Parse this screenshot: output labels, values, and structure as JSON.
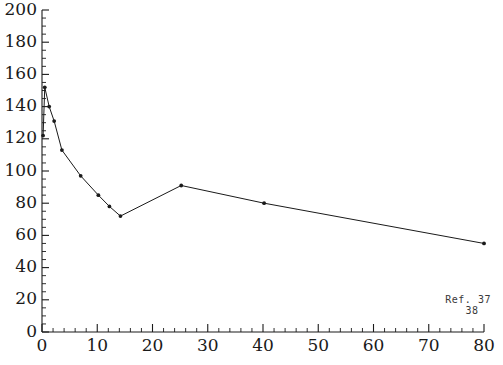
{
  "chart_data": {
    "type": "line",
    "title": "",
    "subtitle": "",
    "xlabel": "",
    "ylabel": "",
    "xlim": [
      0,
      80
    ],
    "ylim": [
      0,
      200
    ],
    "x_major_ticks": [
      0,
      10,
      20,
      30,
      40,
      50,
      60,
      70,
      80
    ],
    "x_tick_labels": [
      "0",
      "10",
      "20",
      "30",
      "40",
      "50",
      "60",
      "70",
      "80"
    ],
    "x_minor_step": 2,
    "y_major_ticks": [
      0,
      20,
      40,
      60,
      80,
      100,
      120,
      140,
      160,
      180,
      200
    ],
    "y_tick_labels": [
      "0",
      "20",
      "40",
      "60",
      "80",
      "100",
      "120",
      "140",
      "160",
      "180",
      "200"
    ],
    "y_minor_step": 5,
    "grid": false,
    "legend": null,
    "marker": "dot",
    "line_style": "solid",
    "series": [
      {
        "name": "series-1",
        "color": "#1a1a1a",
        "points": [
          {
            "x": 0.2,
            "y": 122
          },
          {
            "x": 0.5,
            "y": 152
          },
          {
            "x": 1.3,
            "y": 140
          },
          {
            "x": 2.2,
            "y": 131
          },
          {
            "x": 3.6,
            "y": 113
          },
          {
            "x": 7.0,
            "y": 97
          },
          {
            "x": 10.2,
            "y": 85
          },
          {
            "x": 12.2,
            "y": 78
          },
          {
            "x": 14.2,
            "y": 72
          },
          {
            "x": 25.2,
            "y": 91
          },
          {
            "x": 40.2,
            "y": 80
          },
          {
            "x": 80.0,
            "y": 55
          }
        ]
      }
    ],
    "annotations": [
      {
        "name": "reference-note-line-1",
        "text": "Ref. 37",
        "x": 73,
        "y": 18
      },
      {
        "name": "reference-note-line-2",
        "text": "38",
        "x": 79,
        "y": 11
      }
    ]
  },
  "colors": {
    "axis": "#1a1a1a",
    "series": "#1a1a1a",
    "background": "#ffffff",
    "annotation": "#3a3a3a"
  }
}
